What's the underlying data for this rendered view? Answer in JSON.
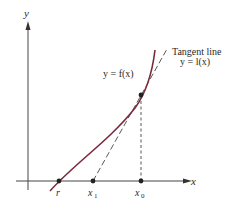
{
  "diagram": {
    "axes": {
      "x_label": "x",
      "y_label": "y"
    },
    "curve": {
      "label": "y = f(x)",
      "color": "#7a2a3a"
    },
    "tangent": {
      "label_line1": "Tangent line",
      "label_line2": "y = l(x)",
      "color": "#333333"
    },
    "points": {
      "root": "r",
      "x1": "x",
      "x1_sub": "1",
      "x0": "x",
      "x0_sub": "0"
    }
  }
}
